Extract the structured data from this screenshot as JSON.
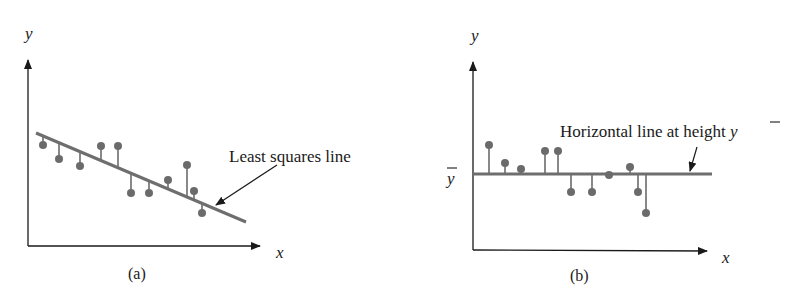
{
  "figure": {
    "colors": {
      "axis": "#1a1a1a",
      "fit_line": "#6e6e6e",
      "points": "#6b6b6b",
      "text": "#1a1a1a"
    },
    "panel_a": {
      "caption": "(a)",
      "x_label": "x",
      "y_label": "y",
      "line_label": "Least squares line",
      "line": {
        "x1": 36,
        "y1": 133,
        "x2": 246,
        "y2": 222
      },
      "points": [
        {
          "x": 43,
          "y": 145
        },
        {
          "x": 59,
          "y": 159
        },
        {
          "x": 80,
          "y": 166
        },
        {
          "x": 101,
          "y": 146
        },
        {
          "x": 118,
          "y": 146
        },
        {
          "x": 131,
          "y": 193
        },
        {
          "x": 149,
          "y": 193
        },
        {
          "x": 168,
          "y": 180
        },
        {
          "x": 187,
          "y": 165
        },
        {
          "x": 194,
          "y": 191
        },
        {
          "x": 202,
          "y": 213
        }
      ]
    },
    "panel_b": {
      "caption": "(b)",
      "x_label": "x",
      "y_label": "y",
      "ybar_label": "y",
      "line_label": "Horizontal line at height",
      "line_label_symbol": "y",
      "line": {
        "x1": 473,
        "y1": 174,
        "x2": 712,
        "y2": 174
      },
      "points": [
        {
          "x": 489,
          "y": 145
        },
        {
          "x": 505,
          "y": 163
        },
        {
          "x": 521,
          "y": 169
        },
        {
          "x": 545,
          "y": 151
        },
        {
          "x": 558,
          "y": 151
        },
        {
          "x": 571,
          "y": 192
        },
        {
          "x": 592,
          "y": 192
        },
        {
          "x": 609,
          "y": 175
        },
        {
          "x": 630,
          "y": 167
        },
        {
          "x": 638,
          "y": 192
        },
        {
          "x": 646,
          "y": 213
        }
      ]
    }
  }
}
